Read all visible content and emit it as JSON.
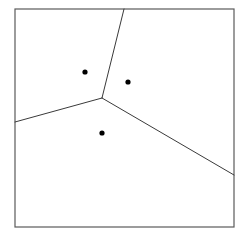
{
  "figure": {
    "type": "voronoi-diagram",
    "width": 246,
    "height": 237,
    "background_color": "#ffffff"
  },
  "frame": {
    "label": "plot-border",
    "x": 15,
    "y": 9,
    "width": 219,
    "height": 218,
    "stroke_color": "#5a5a5a",
    "stroke_width": 1.2,
    "fill": "none"
  },
  "vertex": {
    "label": "voronoi-vertex",
    "x": 102,
    "y": 98,
    "degree": 3
  },
  "sites": [
    {
      "label": "site-upper-left",
      "x": 85,
      "y": 72,
      "radius": 2.6,
      "color": "#000000"
    },
    {
      "label": "site-right",
      "x": 128,
      "y": 82,
      "radius": 2.6,
      "color": "#000000"
    },
    {
      "label": "site-lower",
      "x": 102,
      "y": 133,
      "radius": 2.6,
      "color": "#000000"
    }
  ],
  "edges": [
    {
      "label": "edge-north",
      "from": {
        "x": 102,
        "y": 98
      },
      "to": {
        "x": 124,
        "y": 9
      },
      "stroke_color": "#3a3a3a",
      "stroke_width": 1.0,
      "separates": "site-upper-left | site-right"
    },
    {
      "label": "edge-west",
      "from": {
        "x": 102,
        "y": 98
      },
      "to": {
        "x": 15,
        "y": 122
      },
      "stroke_color": "#3a3a3a",
      "stroke_width": 1.0,
      "separates": "site-upper-left | site-lower"
    },
    {
      "label": "edge-southeast",
      "from": {
        "x": 102,
        "y": 98
      },
      "to": {
        "x": 234,
        "y": 175
      },
      "stroke_color": "#3a3a3a",
      "stroke_width": 1.0,
      "separates": "site-right | site-lower"
    }
  ],
  "cells": [
    {
      "label": "cell-upper-left",
      "site": "site-upper-left",
      "fill": "none"
    },
    {
      "label": "cell-right",
      "site": "site-right",
      "fill": "none"
    },
    {
      "label": "cell-lower",
      "site": "site-lower",
      "fill": "none"
    }
  ]
}
